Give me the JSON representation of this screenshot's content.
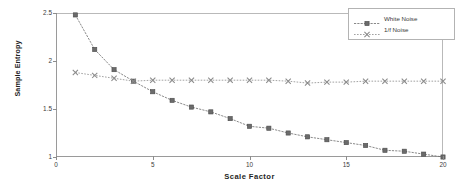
{
  "chart_data": {
    "type": "line",
    "title": "",
    "xlabel": "Scale Factor",
    "ylabel": "Sample Entropy",
    "xlim": [
      0,
      20
    ],
    "ylim": [
      1,
      2.5
    ],
    "xticks": [
      "0",
      "5",
      "10",
      "15",
      "20"
    ],
    "xtick_values": [
      0,
      5,
      10,
      15,
      20
    ],
    "yticks": [
      "1",
      "1.5",
      "2",
      "2.5"
    ],
    "ytick_values": [
      1,
      1.5,
      2,
      2.5
    ],
    "grid": false,
    "legend_position": "top-right",
    "x": [
      1,
      2,
      3,
      4,
      5,
      6,
      7,
      8,
      9,
      10,
      11,
      12,
      13,
      14,
      15,
      16,
      17,
      18,
      19,
      20
    ],
    "series": [
      {
        "name": "White Noise",
        "marker": "square",
        "color": "#6b6b6b",
        "values": [
          2.48,
          2.12,
          1.91,
          1.79,
          1.68,
          1.59,
          1.52,
          1.47,
          1.4,
          1.32,
          1.3,
          1.25,
          1.21,
          1.18,
          1.15,
          1.12,
          1.07,
          1.06,
          1.03,
          1.0
        ]
      },
      {
        "name": "1/f Noise",
        "marker": "x",
        "color": "#8a8a8a",
        "values": [
          1.88,
          1.85,
          1.82,
          1.79,
          1.8,
          1.8,
          1.8,
          1.8,
          1.8,
          1.8,
          1.8,
          1.79,
          1.77,
          1.78,
          1.78,
          1.79,
          1.79,
          1.79,
          1.79,
          1.79
        ]
      }
    ]
  },
  "legend": {
    "items": [
      {
        "label": "White Noise"
      },
      {
        "label": "1/f Noise"
      }
    ]
  }
}
